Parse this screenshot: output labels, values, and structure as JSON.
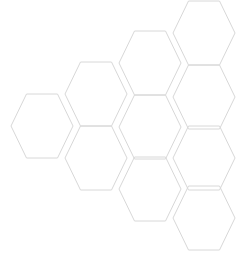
{
  "canvas": {
    "width": 236,
    "height": 261,
    "background_color": "#ffffff",
    "title": "honeycomb-hexagon-pattern"
  },
  "pattern": {
    "name": "honeycomb-grid",
    "shape": "hexagon",
    "orientation": "flat-top",
    "cell_count": 10,
    "stroke_color": "#d8d8d8",
    "stroke_width": 1,
    "fill_color": "none",
    "cell_width": 62,
    "cell_height": 64,
    "column_step_x": 54,
    "column_step_y": -31,
    "row_step_y": 63,
    "cells": [
      {
        "id": "hex-c1-r1",
        "cx": 42,
        "cy": 126,
        "column": 1,
        "row": 1
      },
      {
        "id": "hex-c2-r1",
        "cx": 96,
        "cy": 94,
        "column": 2,
        "row": 1
      },
      {
        "id": "hex-c2-r2",
        "cx": 96,
        "cy": 158,
        "column": 2,
        "row": 2
      },
      {
        "id": "hex-c3-r1",
        "cx": 150,
        "cy": 63,
        "column": 3,
        "row": 1
      },
      {
        "id": "hex-c3-r2",
        "cx": 150,
        "cy": 127,
        "column": 3,
        "row": 2
      },
      {
        "id": "hex-c3-r3",
        "cx": 150,
        "cy": 189,
        "column": 3,
        "row": 3
      },
      {
        "id": "hex-c4-r1",
        "cx": 204,
        "cy": 33,
        "column": 4,
        "row": 1
      },
      {
        "id": "hex-c4-r2",
        "cx": 204,
        "cy": 97,
        "column": 4,
        "row": 2
      },
      {
        "id": "hex-c4-r3",
        "cx": 204,
        "cy": 158,
        "column": 4,
        "row": 3
      },
      {
        "id": "hex-c4-r4",
        "cx": 204,
        "cy": 218,
        "column": 4,
        "row": 4
      }
    ]
  }
}
